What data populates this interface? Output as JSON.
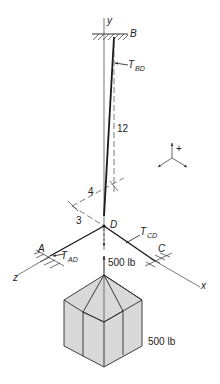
{
  "diagram": {
    "axes": {
      "y": "y",
      "x": "x",
      "z": "z"
    },
    "points": {
      "B": "B",
      "D": "D",
      "A": "A",
      "C": "C"
    },
    "tensions": {
      "BD": {
        "T": "T",
        "sub": "BD"
      },
      "CD": {
        "T": "T",
        "sub": "CD"
      },
      "AD": {
        "T": "T",
        "sub": "AD"
      }
    },
    "dimensions": {
      "vertical": "12",
      "horizontal_4": "4",
      "horizontal_3": "3"
    },
    "loads": {
      "force_at_D": "500 lb",
      "weight_label": "500 lb"
    },
    "sign_convention": {
      "plus": "+"
    },
    "colors": {
      "line": "#1a1a1a",
      "dashed": "#444444",
      "block_fill": "#d9d9d9",
      "block_stroke": "#2a2a2a",
      "hatch": "#333333"
    }
  }
}
